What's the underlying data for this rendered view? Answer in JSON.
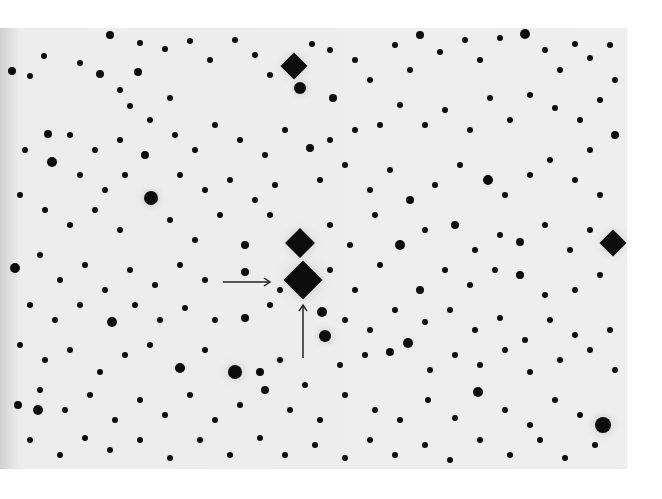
{
  "image": {
    "kind": "negative star field photograph",
    "background": "#ececec",
    "star_color": "#0c0c0c",
    "width": 627,
    "height": 441,
    "offset_top": 28
  },
  "annotations": {
    "arrow_horizontal": {
      "x1": 223,
      "y1": 282,
      "x2": 270,
      "y2": 282
    },
    "arrow_vertical": {
      "x1": 303,
      "y1": 358,
      "x2": 303,
      "y2": 305
    },
    "target_star": {
      "x": 303,
      "y": 281
    }
  },
  "bright_stars": [
    {
      "x": 303,
      "y": 280,
      "r": 13,
      "spike": true
    },
    {
      "x": 300,
      "y": 243,
      "r": 10,
      "spike": true
    },
    {
      "x": 294,
      "y": 66,
      "r": 9,
      "spike": true
    },
    {
      "x": 613,
      "y": 243,
      "r": 9,
      "spike": true
    },
    {
      "x": 603,
      "y": 425,
      "r": 8,
      "spike": false
    },
    {
      "x": 151,
      "y": 198,
      "r": 7,
      "spike": false
    },
    {
      "x": 235,
      "y": 372,
      "r": 7,
      "spike": false
    },
    {
      "x": 300,
      "y": 88,
      "r": 6,
      "spike": false
    },
    {
      "x": 325,
      "y": 336,
      "r": 6,
      "spike": false
    }
  ],
  "stars": [
    [
      110,
      35,
      4
    ],
    [
      140,
      43,
      3
    ],
    [
      165,
      49,
      3
    ],
    [
      190,
      41,
      3
    ],
    [
      44,
      56,
      3
    ],
    [
      80,
      63,
      3
    ],
    [
      12,
      71,
      4
    ],
    [
      30,
      76,
      3
    ],
    [
      100,
      74,
      4
    ],
    [
      138,
      72,
      4
    ],
    [
      120,
      90,
      3
    ],
    [
      130,
      106,
      3
    ],
    [
      150,
      120,
      3
    ],
    [
      170,
      98,
      3
    ],
    [
      210,
      60,
      3
    ],
    [
      235,
      40,
      3
    ],
    [
      255,
      55,
      3
    ],
    [
      270,
      75,
      3
    ],
    [
      312,
      44,
      3
    ],
    [
      330,
      50,
      3
    ],
    [
      333,
      98,
      4
    ],
    [
      355,
      60,
      3
    ],
    [
      370,
      80,
      3
    ],
    [
      395,
      45,
      3
    ],
    [
      410,
      70,
      3
    ],
    [
      420,
      35,
      4
    ],
    [
      440,
      52,
      3
    ],
    [
      465,
      40,
      3
    ],
    [
      480,
      60,
      3
    ],
    [
      500,
      38,
      3
    ],
    [
      525,
      34,
      5
    ],
    [
      545,
      50,
      3
    ],
    [
      560,
      70,
      3
    ],
    [
      575,
      44,
      3
    ],
    [
      590,
      58,
      3
    ],
    [
      610,
      45,
      3
    ],
    [
      615,
      80,
      3
    ],
    [
      600,
      100,
      3
    ],
    [
      580,
      120,
      3
    ],
    [
      555,
      108,
      3
    ],
    [
      530,
      95,
      3
    ],
    [
      510,
      120,
      3
    ],
    [
      490,
      98,
      3
    ],
    [
      470,
      130,
      3
    ],
    [
      445,
      110,
      3
    ],
    [
      425,
      125,
      3
    ],
    [
      400,
      105,
      3
    ],
    [
      380,
      125,
      3
    ],
    [
      355,
      130,
      3
    ],
    [
      330,
      140,
      3
    ],
    [
      310,
      148,
      4
    ],
    [
      285,
      130,
      3
    ],
    [
      265,
      155,
      3
    ],
    [
      240,
      140,
      3
    ],
    [
      215,
      125,
      3
    ],
    [
      195,
      150,
      3
    ],
    [
      175,
      135,
      3
    ],
    [
      145,
      155,
      4
    ],
    [
      120,
      140,
      3
    ],
    [
      95,
      150,
      3
    ],
    [
      70,
      135,
      3
    ],
    [
      48,
      134,
      4
    ],
    [
      25,
      150,
      3
    ],
    [
      52,
      162,
      5
    ],
    [
      80,
      175,
      3
    ],
    [
      105,
      190,
      3
    ],
    [
      125,
      175,
      3
    ],
    [
      180,
      175,
      3
    ],
    [
      205,
      190,
      3
    ],
    [
      230,
      180,
      3
    ],
    [
      255,
      200,
      3
    ],
    [
      275,
      185,
      3
    ],
    [
      320,
      180,
      3
    ],
    [
      345,
      165,
      3
    ],
    [
      370,
      190,
      3
    ],
    [
      390,
      170,
      3
    ],
    [
      410,
      200,
      4
    ],
    [
      435,
      185,
      3
    ],
    [
      460,
      165,
      3
    ],
    [
      488,
      180,
      5
    ],
    [
      505,
      195,
      3
    ],
    [
      530,
      175,
      3
    ],
    [
      550,
      160,
      3
    ],
    [
      575,
      180,
      3
    ],
    [
      600,
      195,
      3
    ],
    [
      615,
      135,
      4
    ],
    [
      590,
      150,
      3
    ],
    [
      20,
      195,
      3
    ],
    [
      45,
      210,
      3
    ],
    [
      70,
      225,
      3
    ],
    [
      95,
      210,
      3
    ],
    [
      120,
      230,
      3
    ],
    [
      170,
      220,
      3
    ],
    [
      195,
      240,
      3
    ],
    [
      220,
      215,
      3
    ],
    [
      245,
      245,
      4
    ],
    [
      270,
      215,
      3
    ],
    [
      330,
      225,
      3
    ],
    [
      350,
      245,
      3
    ],
    [
      375,
      215,
      3
    ],
    [
      400,
      245,
      5
    ],
    [
      425,
      230,
      3
    ],
    [
      455,
      225,
      4
    ],
    [
      475,
      250,
      3
    ],
    [
      500,
      235,
      3
    ],
    [
      520,
      242,
      4
    ],
    [
      545,
      225,
      3
    ],
    [
      570,
      250,
      3
    ],
    [
      590,
      230,
      3
    ],
    [
      15,
      268,
      5
    ],
    [
      40,
      255,
      3
    ],
    [
      60,
      280,
      3
    ],
    [
      85,
      265,
      3
    ],
    [
      105,
      290,
      3
    ],
    [
      130,
      270,
      3
    ],
    [
      155,
      285,
      3
    ],
    [
      180,
      265,
      3
    ],
    [
      205,
      280,
      3
    ],
    [
      245,
      272,
      4
    ],
    [
      280,
      290,
      3
    ],
    [
      330,
      270,
      3
    ],
    [
      355,
      290,
      3
    ],
    [
      380,
      265,
      3
    ],
    [
      420,
      290,
      4
    ],
    [
      445,
      270,
      3
    ],
    [
      470,
      285,
      3
    ],
    [
      495,
      270,
      3
    ],
    [
      520,
      275,
      4
    ],
    [
      545,
      295,
      3
    ],
    [
      575,
      290,
      3
    ],
    [
      600,
      275,
      3
    ],
    [
      30,
      305,
      3
    ],
    [
      55,
      320,
      3
    ],
    [
      80,
      305,
      3
    ],
    [
      112,
      322,
      5
    ],
    [
      135,
      305,
      3
    ],
    [
      160,
      320,
      3
    ],
    [
      185,
      308,
      3
    ],
    [
      215,
      320,
      3
    ],
    [
      245,
      318,
      4
    ],
    [
      270,
      305,
      3
    ],
    [
      322,
      312,
      5
    ],
    [
      345,
      320,
      3
    ],
    [
      370,
      330,
      3
    ],
    [
      395,
      310,
      3
    ],
    [
      425,
      322,
      3
    ],
    [
      450,
      310,
      3
    ],
    [
      475,
      330,
      3
    ],
    [
      500,
      318,
      3
    ],
    [
      525,
      340,
      3
    ],
    [
      550,
      320,
      3
    ],
    [
      575,
      335,
      3
    ],
    [
      610,
      330,
      3
    ],
    [
      20,
      345,
      3
    ],
    [
      45,
      360,
      3
    ],
    [
      70,
      350,
      3
    ],
    [
      100,
      372,
      3
    ],
    [
      125,
      355,
      3
    ],
    [
      150,
      345,
      3
    ],
    [
      180,
      368,
      5
    ],
    [
      205,
      350,
      3
    ],
    [
      260,
      372,
      4
    ],
    [
      280,
      360,
      3
    ],
    [
      305,
      385,
      3
    ],
    [
      340,
      365,
      3
    ],
    [
      365,
      355,
      3
    ],
    [
      390,
      352,
      4
    ],
    [
      408,
      343,
      5
    ],
    [
      430,
      370,
      3
    ],
    [
      455,
      355,
      3
    ],
    [
      480,
      365,
      3
    ],
    [
      505,
      350,
      3
    ],
    [
      530,
      372,
      3
    ],
    [
      560,
      360,
      3
    ],
    [
      590,
      350,
      3
    ],
    [
      615,
      370,
      3
    ],
    [
      18,
      405,
      4
    ],
    [
      40,
      390,
      3
    ],
    [
      65,
      410,
      3
    ],
    [
      90,
      395,
      3
    ],
    [
      115,
      420,
      3
    ],
    [
      140,
      400,
      3
    ],
    [
      165,
      415,
      3
    ],
    [
      190,
      395,
      3
    ],
    [
      215,
      420,
      3
    ],
    [
      240,
      405,
      3
    ],
    [
      265,
      390,
      4
    ],
    [
      290,
      410,
      3
    ],
    [
      320,
      420,
      3
    ],
    [
      345,
      395,
      3
    ],
    [
      375,
      410,
      3
    ],
    [
      400,
      420,
      3
    ],
    [
      428,
      400,
      3
    ],
    [
      455,
      418,
      3
    ],
    [
      478,
      392,
      5
    ],
    [
      505,
      410,
      3
    ],
    [
      530,
      425,
      3
    ],
    [
      555,
      400,
      3
    ],
    [
      580,
      415,
      3
    ],
    [
      30,
      440,
      3
    ],
    [
      60,
      455,
      3
    ],
    [
      85,
      438,
      3
    ],
    [
      110,
      450,
      3
    ],
    [
      140,
      440,
      3
    ],
    [
      170,
      458,
      3
    ],
    [
      200,
      440,
      3
    ],
    [
      230,
      455,
      3
    ],
    [
      260,
      438,
      3
    ],
    [
      285,
      455,
      3
    ],
    [
      315,
      445,
      3
    ],
    [
      345,
      458,
      3
    ],
    [
      370,
      440,
      3
    ],
    [
      395,
      455,
      3
    ],
    [
      425,
      445,
      3
    ],
    [
      450,
      460,
      3
    ],
    [
      480,
      440,
      3
    ],
    [
      510,
      455,
      3
    ],
    [
      540,
      440,
      3
    ],
    [
      565,
      458,
      3
    ],
    [
      595,
      445,
      3
    ],
    [
      38,
      410,
      5
    ]
  ]
}
